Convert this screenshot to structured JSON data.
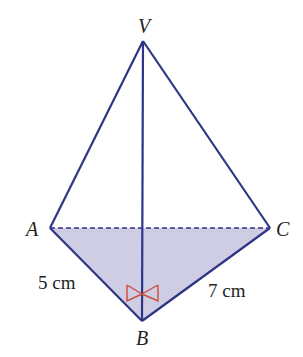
{
  "figure": {
    "type": "triangular-pyramid",
    "vertices": {
      "V": {
        "label": "V",
        "x": 143,
        "y": 41
      },
      "A": {
        "label": "A",
        "x": 50,
        "y": 228
      },
      "C": {
        "label": "C",
        "x": 270,
        "y": 228
      },
      "B": {
        "label": "B",
        "x": 142,
        "y": 321
      }
    },
    "edges": [
      {
        "from": "V",
        "to": "A",
        "style": "solid"
      },
      {
        "from": "V",
        "to": "C",
        "style": "solid"
      },
      {
        "from": "V",
        "to": "B",
        "style": "solid"
      },
      {
        "from": "A",
        "to": "B",
        "style": "solid"
      },
      {
        "from": "B",
        "to": "C",
        "style": "solid"
      },
      {
        "from": "A",
        "to": "C",
        "style": "dashed"
      }
    ],
    "shaded_face": [
      "A",
      "B",
      "C"
    ],
    "measurements": {
      "AB": "5 cm",
      "BC": "7 cm"
    },
    "right_angle_markers": [
      "VBA",
      "VBC"
    ],
    "colors": {
      "edge": "#2e3584",
      "shade": "#c3c3de",
      "right_angle": "#d04a3a",
      "text": "#231f20"
    }
  }
}
